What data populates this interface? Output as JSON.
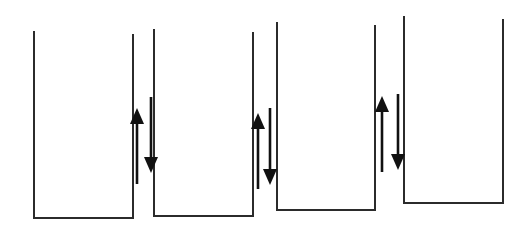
{
  "diagram": {
    "title": "",
    "colors": {
      "line": "#2b2b2b",
      "arrow": "#111111",
      "background": "#ffffff"
    },
    "containers": [
      {
        "id": "container-1",
        "left": 34,
        "right": 133,
        "left_top": 31,
        "right_top": 34,
        "bottom": 218
      },
      {
        "id": "container-2",
        "left": 154,
        "right": 253,
        "left_top": 29,
        "right_top": 32,
        "bottom": 216
      },
      {
        "id": "container-3",
        "left": 277,
        "right": 375,
        "left_top": 22,
        "right_top": 25,
        "bottom": 210
      },
      {
        "id": "container-4",
        "left": 404,
        "right": 503,
        "left_top": 16,
        "right_top": 19,
        "bottom": 203
      }
    ],
    "arrow_pairs": [
      {
        "between": [
          "container-1",
          "container-2"
        ],
        "up": {
          "x": 137,
          "tip": 108,
          "tail": 184
        },
        "down": {
          "x": 151,
          "tail": 97,
          "tip": 173
        }
      },
      {
        "between": [
          "container-2",
          "container-3"
        ],
        "up": {
          "x": 258,
          "tip": 113,
          "tail": 189
        },
        "down": {
          "x": 270,
          "tail": 108,
          "tip": 185
        }
      },
      {
        "between": [
          "container-3",
          "container-4"
        ],
        "up": {
          "x": 382,
          "tip": 96,
          "tail": 172
        },
        "down": {
          "x": 398,
          "tail": 94,
          "tip": 170
        }
      }
    ]
  }
}
